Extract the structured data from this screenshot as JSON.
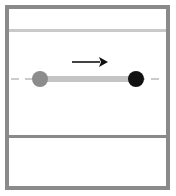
{
  "diagram": {
    "colors": {
      "frame": "#8a8a8a",
      "top_line": "#c9c9c9",
      "dashed_track": "#cccccc",
      "path_bar": "#c4c4c4",
      "start_ball": "#8c8c8c",
      "end_ball": "#111111",
      "arrow": "#111111",
      "divider": "#8a8a8a"
    },
    "elements": {
      "start_ball": {
        "cx": 40,
        "cy": 79,
        "r": 8
      },
      "end_ball": {
        "cx": 136,
        "cy": 79,
        "r": 8
      },
      "path_bar": {
        "x1": 40,
        "x2": 136,
        "y": 79,
        "thickness": 6
      },
      "arrow": {
        "x1": 72,
        "x2": 107,
        "y": 62,
        "direction": "right",
        "icon": "arrow-right-icon"
      },
      "dashed_track": {
        "y": 79
      }
    }
  }
}
